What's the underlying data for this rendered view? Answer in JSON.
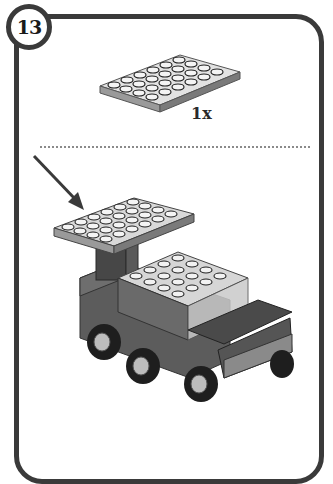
{
  "step": {
    "number": "13"
  },
  "parts_callout": {
    "part_name": "4x6 plate",
    "part_icon": "plate-4x6-icon",
    "quantity": "1x",
    "color": "#cfcfcf"
  },
  "assembly": {
    "description": "Truck model with 4x6 plate attached on top of pillar",
    "arrow_icon": "arrow-down-right-icon"
  },
  "colors": {
    "border": "#3a3a3a",
    "plate_light": "#d4d4d4",
    "body_dark": "#5a5a5a",
    "tire": "#1e1e1e",
    "transparent_brick": "#c8c8c8"
  }
}
